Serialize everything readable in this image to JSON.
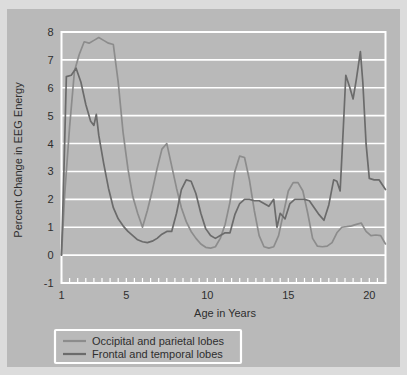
{
  "figure": {
    "background_color": "#dcdcdc",
    "panel_color": "#b9b9b9",
    "grid_color": "#ffffff"
  },
  "chart_data": {
    "type": "line",
    "title": "",
    "xlabel": "Age in Years",
    "ylabel": "Percent Change in EEG Energy",
    "xlim": [
      1,
      21
    ],
    "ylim": [
      -1,
      8
    ],
    "xticks": [
      1,
      5,
      10,
      15,
      20
    ],
    "xtick_labels": [
      "1",
      "5",
      "10",
      "15",
      "20"
    ],
    "yticks": [
      -1,
      0,
      1,
      2,
      3,
      4,
      5,
      6,
      7,
      8
    ],
    "ytick_labels": [
      "-1",
      "0",
      "1",
      "2",
      "3",
      "4",
      "5",
      "6",
      "7",
      "8"
    ],
    "minor_xticks_every": 0.5,
    "grid": "horizontal",
    "legend_position": "below-plot-left",
    "series": [
      {
        "name": "Occipital and parietal lobes",
        "color": "#8c8c8c",
        "x": [
          1.0,
          1.2,
          1.5,
          1.8,
          2.1,
          2.4,
          2.7,
          3.0,
          3.3,
          3.6,
          3.9,
          4.2,
          4.5,
          4.8,
          5.1,
          5.4,
          5.7,
          6.0,
          6.3,
          6.6,
          6.9,
          7.2,
          7.5,
          7.8,
          8.1,
          8.4,
          8.7,
          9.0,
          9.3,
          9.6,
          9.9,
          10.2,
          10.5,
          10.8,
          11.1,
          11.4,
          11.7,
          12.0,
          12.3,
          12.6,
          12.9,
          13.2,
          13.5,
          13.8,
          14.1,
          14.4,
          14.7,
          15.0,
          15.3,
          15.6,
          15.9,
          16.2,
          16.5,
          16.8,
          17.1,
          17.4,
          17.7,
          18.0,
          18.3,
          18.6,
          18.9,
          19.2,
          19.5,
          19.8,
          20.1,
          20.4,
          20.7,
          21.0
        ],
        "y": [
          0.0,
          2.2,
          4.6,
          6.6,
          7.2,
          7.65,
          7.6,
          7.7,
          7.8,
          7.7,
          7.6,
          7.55,
          6.2,
          4.4,
          3.1,
          2.1,
          1.5,
          1.0,
          1.6,
          2.3,
          3.1,
          3.8,
          4.0,
          3.2,
          2.4,
          1.7,
          1.2,
          0.85,
          0.6,
          0.4,
          0.28,
          0.25,
          0.3,
          0.6,
          1.1,
          1.9,
          3.0,
          3.55,
          3.5,
          2.7,
          1.6,
          0.7,
          0.3,
          0.25,
          0.3,
          0.7,
          1.5,
          2.3,
          2.6,
          2.6,
          2.3,
          1.5,
          0.6,
          0.32,
          0.3,
          0.32,
          0.45,
          0.8,
          1.0,
          1.02,
          1.05,
          1.1,
          1.15,
          0.85,
          0.7,
          0.72,
          0.7,
          0.4
        ]
      },
      {
        "name": "Frontal and temporal lobes",
        "color": "#6b6b6b",
        "x": [
          1.0,
          1.15,
          1.3,
          1.6,
          1.9,
          2.2,
          2.5,
          2.8,
          3.0,
          3.15,
          3.3,
          3.6,
          3.9,
          4.2,
          4.5,
          4.8,
          5.1,
          5.4,
          5.7,
          6.0,
          6.3,
          6.6,
          6.9,
          7.2,
          7.5,
          7.8,
          8.1,
          8.4,
          8.7,
          9.0,
          9.3,
          9.6,
          9.9,
          10.2,
          10.5,
          10.8,
          11.1,
          11.4,
          11.7,
          12.0,
          12.3,
          12.6,
          12.9,
          13.2,
          13.5,
          13.8,
          14.1,
          14.3,
          14.5,
          14.8,
          15.1,
          15.4,
          15.7,
          16.0,
          16.3,
          16.6,
          16.9,
          17.2,
          17.5,
          17.8,
          18.0,
          18.2,
          18.4,
          18.55,
          18.8,
          19.0,
          19.2,
          19.45,
          19.6,
          19.8,
          20.0,
          20.3,
          20.6,
          21.0
        ],
        "y": [
          0.0,
          3.0,
          6.4,
          6.45,
          6.7,
          6.2,
          5.4,
          4.8,
          4.65,
          5.05,
          4.3,
          3.3,
          2.4,
          1.7,
          1.3,
          1.05,
          0.85,
          0.7,
          0.55,
          0.48,
          0.45,
          0.5,
          0.6,
          0.75,
          0.85,
          0.85,
          1.5,
          2.35,
          2.7,
          2.65,
          2.2,
          1.5,
          0.95,
          0.7,
          0.6,
          0.7,
          0.8,
          0.8,
          1.45,
          1.85,
          2.0,
          2.0,
          1.95,
          1.95,
          1.85,
          1.75,
          2.0,
          1.0,
          1.5,
          1.3,
          1.85,
          2.0,
          2.0,
          2.0,
          1.95,
          1.7,
          1.45,
          1.25,
          1.8,
          2.7,
          2.65,
          2.3,
          4.6,
          6.45,
          6.0,
          5.6,
          6.3,
          7.3,
          6.2,
          4.0,
          2.75,
          2.7,
          2.7,
          2.35
        ]
      }
    ]
  },
  "legend": {
    "entries": [
      {
        "label": "Occipital and parietal lobes",
        "color": "#8c8c8c"
      },
      {
        "label": "Frontal and temporal lobes",
        "color": "#6b6b6b"
      }
    ]
  },
  "axes": {
    "y_title": "Percent Change in EEG Energy",
    "x_title": "Age in Years"
  }
}
